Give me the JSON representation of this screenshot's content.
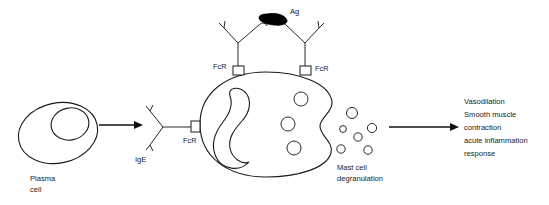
{
  "diagram": {
    "background_color": "#ffffff",
    "line_color": "#1a1a1a",
    "antigen_color": "#000000"
  },
  "plasma_cell": {
    "label_line1": "Plasma",
    "label_line2": "cell"
  },
  "antibody": {
    "ige_label": "IgE"
  },
  "antigen": {
    "label": "Ag"
  },
  "receptors": {
    "membrane_label": "FcR",
    "left_top_label": "FcR",
    "right_top_label": "FcR"
  },
  "degranulation": {
    "label_line1": "Mast cell",
    "label_line2": "degranulation"
  },
  "outcomes": {
    "line1": "Vasodilation",
    "line2": "Smooth muscle",
    "line3": "contraction",
    "line4": "acute inflammation",
    "line5": "response"
  }
}
